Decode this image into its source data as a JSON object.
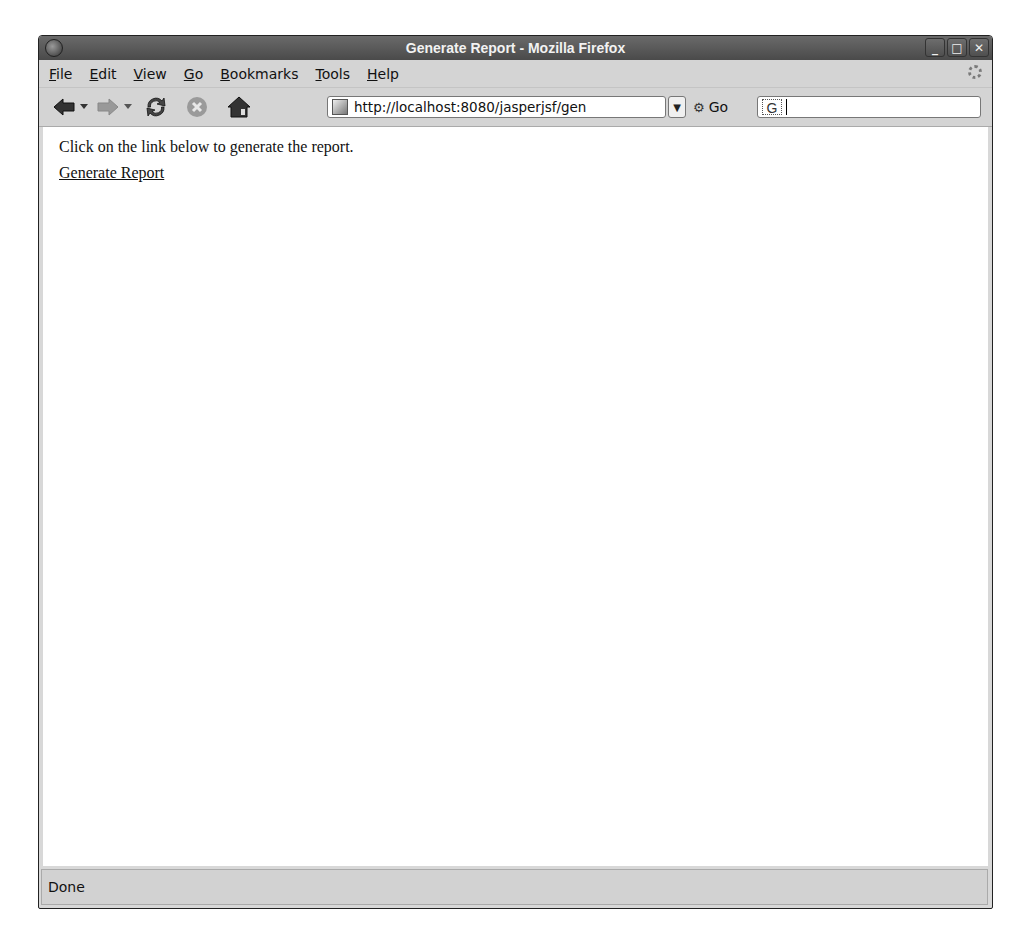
{
  "window": {
    "title": "Generate Report - Mozilla Firefox",
    "controls": {
      "minimize": "_",
      "maximize": "□",
      "close": "✕"
    }
  },
  "menubar": {
    "items": [
      {
        "label": "File",
        "accel": "F",
        "rest": "ile"
      },
      {
        "label": "Edit",
        "accel": "E",
        "rest": "dit"
      },
      {
        "label": "View",
        "accel": "V",
        "rest": "iew"
      },
      {
        "label": "Go",
        "accel": "G",
        "rest": "o"
      },
      {
        "label": "Bookmarks",
        "accel": "B",
        "rest": "ookmarks"
      },
      {
        "label": "Tools",
        "accel": "T",
        "rest": "ools"
      },
      {
        "label": "Help",
        "accel": "H",
        "rest": "elp"
      }
    ]
  },
  "navbar": {
    "back_icon": "back-arrow-icon",
    "forward_icon": "forward-arrow-icon",
    "reload_icon": "reload-icon",
    "stop_icon": "stop-icon",
    "home_icon": "home-icon",
    "url": "http://localhost:8080/jasperjsf/gen",
    "go_label": "Go",
    "search_engine_glyph": "G",
    "search_value": ""
  },
  "page": {
    "intro_text": "Click on the link below to generate the report.",
    "link_text": "Generate Report"
  },
  "statusbar": {
    "text": "Done"
  }
}
